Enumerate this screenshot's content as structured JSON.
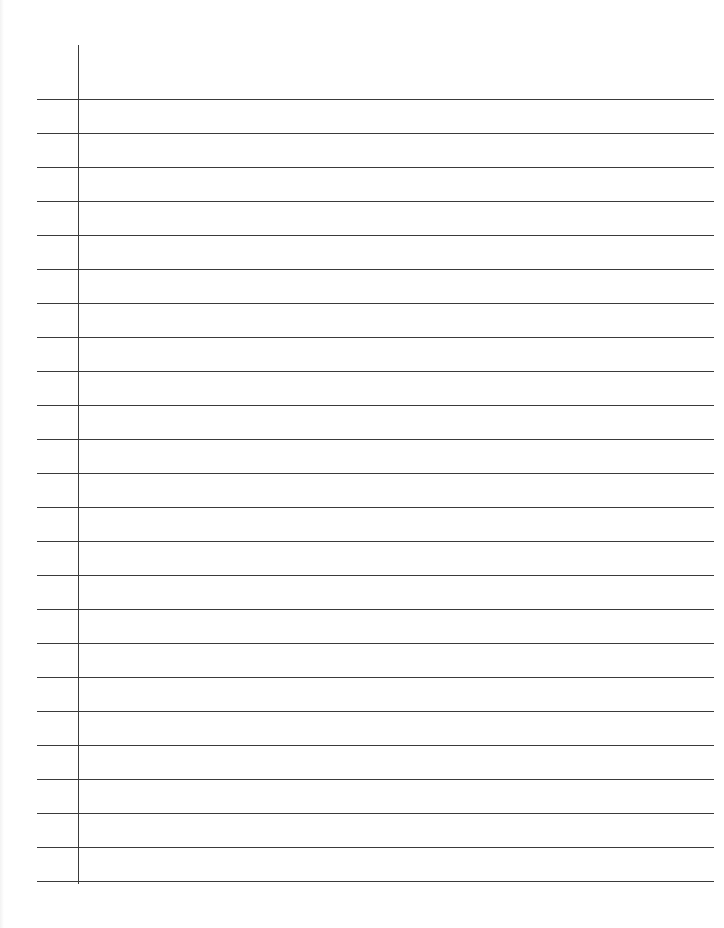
{
  "document": {
    "type": "lined-paper",
    "background_color": "#ffffff",
    "line_color": "#3a3a3a",
    "margin_line": {
      "x": 78,
      "top": 45,
      "bottom": 884
    },
    "rules": {
      "count": 24,
      "first_y": 99,
      "spacing": 34,
      "left": 37,
      "right": 714
    }
  }
}
